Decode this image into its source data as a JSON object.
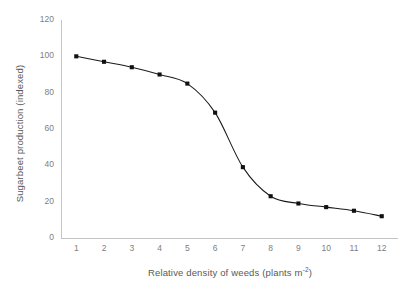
{
  "chart_data": {
    "type": "line",
    "title": "",
    "xlabel": "Relative density of weeds (plants m",
    "xlabel_sup": "-2",
    "xlabel_tail": ")",
    "xlabel_full": "Relative density of weeds (plants m-2)",
    "ylabel": "Sugarbeet  production (indexed)",
    "x": [
      1,
      2,
      3,
      4,
      5,
      6,
      7,
      8,
      9,
      10,
      11,
      12
    ],
    "values": [
      100,
      97,
      94,
      90,
      85,
      69,
      39,
      23,
      19,
      17,
      15,
      12
    ],
    "xticklabels": [
      "1",
      "2",
      "3",
      "4",
      "5",
      "6",
      "7",
      "8",
      "9",
      "10",
      "11",
      "12"
    ],
    "yticklabels": [
      "0",
      "20",
      "40",
      "60",
      "80",
      "100",
      "120"
    ],
    "yticks": [
      0,
      20,
      40,
      60,
      80,
      100,
      120
    ],
    "xlim": [
      0.45,
      12.55
    ],
    "ylim": [
      0,
      120
    ],
    "grid": false,
    "legend": false,
    "marker": "square",
    "marker_color": "#111111",
    "line_color": "#1a1a1a",
    "axis_color": "#c4c4c4",
    "tick_label_color": "#808080",
    "axis_title_color": "#595959",
    "background": "#ffffff"
  }
}
